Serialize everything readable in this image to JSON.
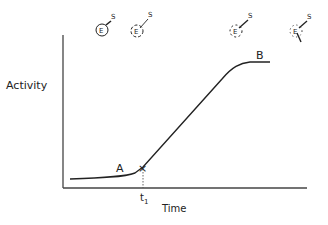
{
  "figure": {
    "type": "enzyme activity vs time diagram",
    "y_axis_label": "Activity",
    "x_axis_label": "Time",
    "time_marker": {
      "base": "t",
      "subscript": "1"
    },
    "point_labels": {
      "a": "A",
      "b": "B"
    },
    "cross_marker": "×",
    "enzyme_states": [
      {
        "enzyme": "E",
        "substrate": "S",
        "state": "intact enzyme with bound substrate",
        "circle": "solid"
      },
      {
        "enzyme": "E",
        "substrate": "S",
        "state": "enzyme partially unfolding",
        "circle": "dashed"
      },
      {
        "enzyme": "E",
        "substrate": "S",
        "state": "enzyme loosened",
        "circle": "dashed"
      },
      {
        "enzyme": "E",
        "substrate": "S",
        "state": "enzyme opening, product released",
        "circle": "dotted"
      }
    ]
  },
  "colors": {
    "ink": "#222222",
    "background": "#ffffff"
  }
}
